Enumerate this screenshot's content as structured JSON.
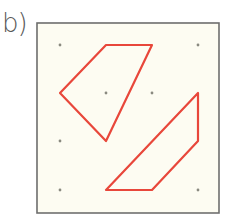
{
  "label": "b)",
  "colors": {
    "paper": "#fdfcf2",
    "border": "#555555",
    "dot": "#8a8a80",
    "polygon": "#e8473a"
  },
  "diagram": {
    "type": "dot-grid-with-polygons",
    "grid": {
      "columns": 4,
      "rows": 4,
      "visible_dots": [
        {
          "col": 0,
          "row": 0
        },
        {
          "col": 3,
          "row": 0
        },
        {
          "col": 1,
          "row": 1
        },
        {
          "col": 2,
          "row": 1
        },
        {
          "col": 0,
          "row": 2
        },
        {
          "col": 0,
          "row": 3
        },
        {
          "col": 3,
          "row": 3
        }
      ]
    },
    "polygons": [
      {
        "name": "upper-quadrilateral",
        "vertices_grid": [
          [
            1,
            0
          ],
          [
            2,
            0
          ],
          [
            1,
            2
          ],
          [
            0,
            1
          ]
        ]
      },
      {
        "name": "lower-quadrilateral",
        "vertices_grid": [
          [
            3,
            1
          ],
          [
            3,
            2
          ],
          [
            2,
            3
          ],
          [
            1,
            3
          ]
        ]
      }
    ]
  }
}
